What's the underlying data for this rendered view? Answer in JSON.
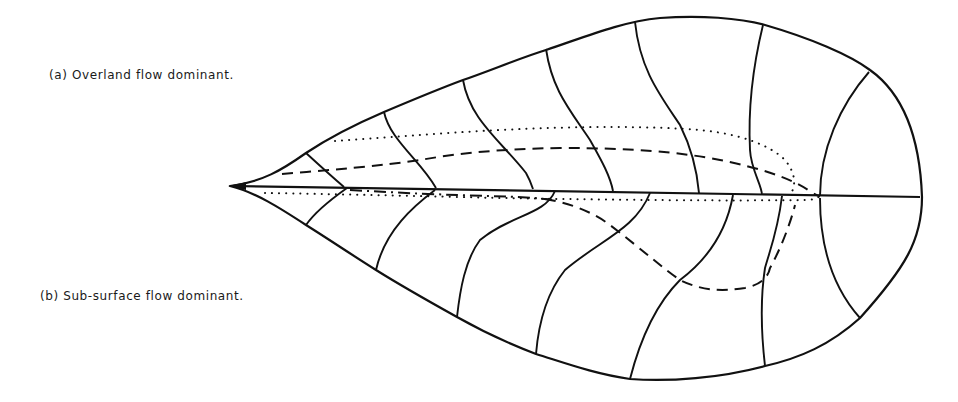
{
  "figure": {
    "labels": {
      "a": "(a) Overland flow dominant.",
      "b": "(b) Sub-surface flow dominant."
    }
  },
  "legend_styles": {
    "dotted": "boundary line",
    "dashed": "flow path",
    "dash_dot": "flow path",
    "solid": "contour / outline"
  },
  "colors": {
    "ink": "#111111",
    "background": "#ffffff"
  }
}
